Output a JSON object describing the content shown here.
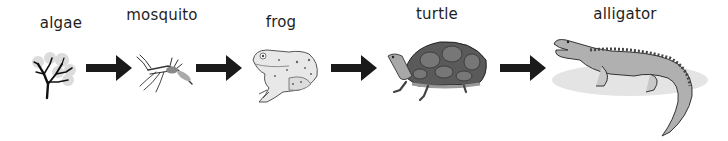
{
  "diagram": {
    "type": "food-chain",
    "direction": "left-to-right",
    "arrow_color": "#1a1a1a",
    "nodes": [
      {
        "label": "algae",
        "icon": "algae-icon"
      },
      {
        "label": "mosquito",
        "icon": "mosquito-icon"
      },
      {
        "label": "frog",
        "icon": "frog-icon"
      },
      {
        "label": "turtle",
        "icon": "turtle-icon"
      },
      {
        "label": "alligator",
        "icon": "alligator-icon"
      }
    ],
    "edges": [
      {
        "from": "algae",
        "to": "mosquito"
      },
      {
        "from": "mosquito",
        "to": "frog"
      },
      {
        "from": "frog",
        "to": "turtle"
      },
      {
        "from": "turtle",
        "to": "alligator"
      }
    ]
  }
}
